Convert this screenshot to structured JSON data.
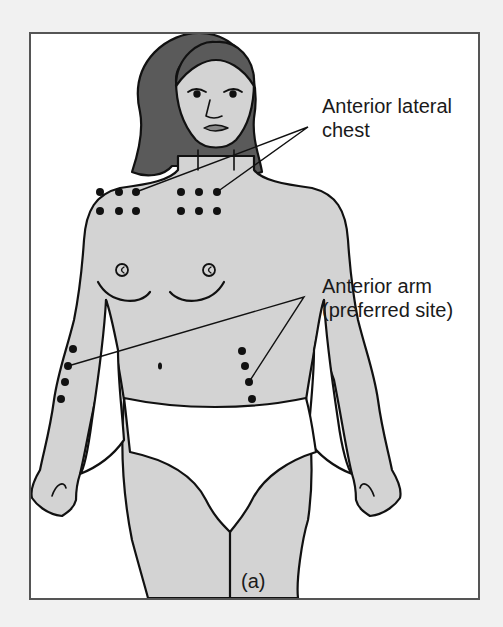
{
  "figure": {
    "panel_label": "(a)",
    "colors": {
      "background": "#f1f1f1",
      "frame_bg": "#ffffff",
      "frame_border": "#555555",
      "skin": "#d3d3d3",
      "hair": "#5a5a5a",
      "outline": "#111111",
      "dot": "#111111",
      "underwear": "#ffffff"
    },
    "callouts": [
      {
        "id": "anterior-lateral-chest",
        "lines": [
          "Anterior lateral",
          "chest"
        ],
        "dots_per_site": 6,
        "sites": 2
      },
      {
        "id": "anterior-arm",
        "lines": [
          "Anterior arm",
          "(preferred site)"
        ],
        "dots_per_site": 4,
        "sites": 2
      }
    ]
  }
}
